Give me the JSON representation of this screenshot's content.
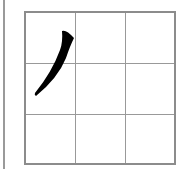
{
  "worksheet": {
    "character": "丿",
    "stroke_name": "pie (left-falling stroke)",
    "grid": {
      "rows": 3,
      "cols": 3
    },
    "colors": {
      "grid": "#8c8c8c",
      "stroke": "#000000",
      "background": "#ffffff"
    }
  }
}
